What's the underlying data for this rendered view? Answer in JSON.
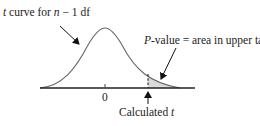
{
  "figure": {
    "curve_label_prefix": "t",
    "curve_label_mid": " curve for ",
    "curve_label_n": "n",
    "curve_label_suffix": " − 1 df",
    "pvalue_label_prefix": "P",
    "pvalue_label_suffix": "-value = area in upper tail",
    "zero_tick_label": "0",
    "calculated_label_prefix": "Calculated ",
    "calculated_label_t": "t"
  },
  "colors": {
    "curve": "#555555",
    "axis": "#222222",
    "shade": "#d9d9d9",
    "arrow": "#111111"
  }
}
